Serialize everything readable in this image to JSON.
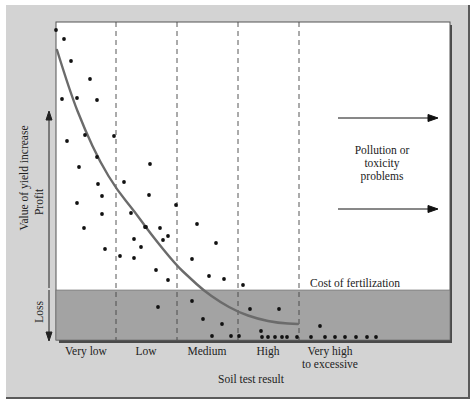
{
  "chart_data": {
    "type": "scatter",
    "title": "",
    "xlabel": "Soil test result",
    "ylabel": "Value of yield increase",
    "y_regions": [
      {
        "label": "Profit",
        "direction": "up"
      },
      {
        "label": "Loss",
        "direction": "down"
      }
    ],
    "categories": [
      "Very low",
      "Low",
      "Medium",
      "High",
      "Very high\nto excessive"
    ],
    "category_labels": [
      {
        "lines": [
          "Very low"
        ]
      },
      {
        "lines": [
          "Low"
        ]
      },
      {
        "lines": [
          "Medium"
        ]
      },
      {
        "lines": [
          "High"
        ]
      },
      {
        "lines": [
          "Very high",
          "to excessive"
        ]
      }
    ],
    "threshold_label": "Cost of fertilization",
    "annotation": {
      "lines": [
        "Pollution or",
        "toxicity",
        "problems"
      ]
    },
    "grid": false,
    "legend": null,
    "curve": {
      "description": "Decreasing response curve from very low to high soil test, flattening below cost of fertilization",
      "points_px": [
        [
          57,
          50
        ],
        [
          70,
          92
        ],
        [
          85,
          130
        ],
        [
          100,
          162
        ],
        [
          117,
          190
        ],
        [
          135,
          212
        ],
        [
          150,
          233
        ],
        [
          176,
          265
        ],
        [
          190,
          278
        ],
        [
          203,
          290
        ],
        [
          220,
          302
        ],
        [
          238,
          312
        ],
        [
          258,
          319
        ],
        [
          278,
          323
        ],
        [
          298,
          324
        ]
      ]
    },
    "scatter_points_px": [
      [
        56,
        30
      ],
      [
        64,
        39
      ],
      [
        71,
        61
      ],
      [
        90,
        79
      ],
      [
        62,
        99
      ],
      [
        77,
        98
      ],
      [
        97,
        100
      ],
      [
        67,
        141
      ],
      [
        85,
        135
      ],
      [
        114,
        136
      ],
      [
        97,
        157
      ],
      [
        79,
        167
      ],
      [
        98,
        184
      ],
      [
        124,
        182
      ],
      [
        77,
        203
      ],
      [
        102,
        196
      ],
      [
        150,
        164
      ],
      [
        149,
        195
      ],
      [
        131,
        213
      ],
      [
        102,
        214
      ],
      [
        84,
        228
      ],
      [
        146,
        227
      ],
      [
        160,
        228
      ],
      [
        176,
        205
      ],
      [
        197,
        224
      ],
      [
        145,
        227
      ],
      [
        168,
        236
      ],
      [
        134,
        239
      ],
      [
        105,
        249
      ],
      [
        120,
        256
      ],
      [
        134,
        258
      ],
      [
        141,
        247
      ],
      [
        163,
        240
      ],
      [
        216,
        243
      ],
      [
        156,
        270
      ],
      [
        168,
        280
      ],
      [
        192,
        259
      ],
      [
        209,
        276
      ],
      [
        224,
        279
      ],
      [
        243,
        285
      ],
      [
        158,
        307
      ],
      [
        192,
        301
      ],
      [
        203,
        319
      ],
      [
        222,
        324
      ],
      [
        212,
        336
      ],
      [
        231,
        336
      ],
      [
        239,
        336
      ],
      [
        250,
        309
      ],
      [
        279,
        309
      ],
      [
        261,
        331
      ],
      [
        262,
        337
      ],
      [
        268,
        337
      ],
      [
        275,
        337
      ],
      [
        282,
        337
      ],
      [
        287,
        337
      ],
      [
        297,
        337
      ],
      [
        311,
        337
      ],
      [
        320,
        326
      ],
      [
        325,
        337
      ],
      [
        335,
        337
      ],
      [
        345,
        337
      ],
      [
        356,
        337
      ],
      [
        367,
        337
      ],
      [
        376,
        337
      ]
    ]
  },
  "colors": {
    "panel": "#d3d3d3",
    "plot_bg": "#ffffff",
    "loss_band": "#a3a3a3",
    "curve": "#6b6b6b",
    "points": "#111111",
    "frame_shadow": "#4a4a4a"
  }
}
